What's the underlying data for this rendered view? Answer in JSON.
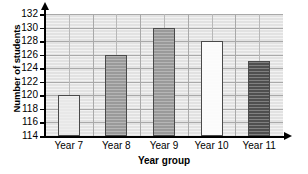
{
  "chart_data": {
    "type": "bar",
    "title": "",
    "xlabel": "Year group",
    "ylabel": "Number of students",
    "categories": [
      "Year 7",
      "Year 8",
      "Year 9",
      "Year 10",
      "Year 11"
    ],
    "values": [
      120,
      126,
      130,
      128,
      125
    ],
    "ylim": [
      114,
      132
    ],
    "ytick_step": 2,
    "yticks": [
      132,
      130,
      128,
      126,
      124,
      122,
      120,
      118,
      116,
      114
    ],
    "ytick_labels": [
      "132",
      "130",
      "128",
      "126",
      "124",
      "122",
      "120",
      "118",
      "116",
      "114"
    ],
    "grid": true,
    "legend": "none",
    "bar_colors": [
      "#e8e8e8",
      "#9a9a9a",
      "#9a9a9a",
      "#fbfbfb",
      "#4f4f4f"
    ],
    "bar_edge_color": "#4a4a4a",
    "plot_background": "#e2e2e2",
    "grid_color": "#a9a9a9",
    "axis_color": "#000000",
    "bars": [
      {
        "category": "Year 7",
        "value": 120,
        "color": "#e8e8e8"
      },
      {
        "category": "Year 8",
        "value": 126,
        "color": "#9a9a9a"
      },
      {
        "category": "Year 9",
        "value": 130,
        "color": "#9a9a9a"
      },
      {
        "category": "Year 10",
        "value": 128,
        "color": "#fbfbfb"
      },
      {
        "category": "Year 11",
        "value": 125,
        "color": "#4f4f4f"
      }
    ]
  }
}
